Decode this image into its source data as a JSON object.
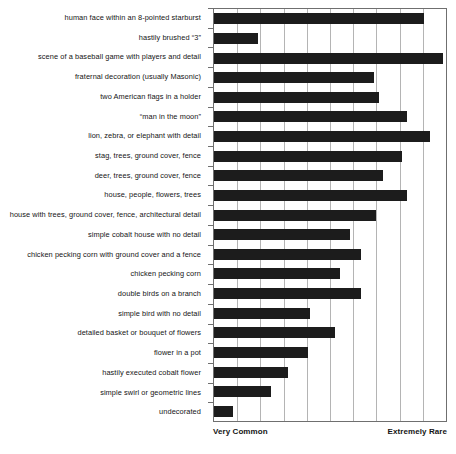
{
  "chart_data": {
    "type": "bar",
    "orientation": "horizontal",
    "title": "",
    "xlabel": "",
    "ylabel": "",
    "xlim": [
      0,
      10
    ],
    "grid": true,
    "axis_captions": {
      "left": "Very Common",
      "right": "Extremely Rare"
    },
    "categories": [
      "human face within an 8-pointed starburst",
      "hastily brushed “3”",
      "scene of a baseball game with players and detail",
      "fraternal decoration (usually Masonic)",
      "two American flags in a holder",
      "“man in the moon”",
      "lion, zebra, or elephant with detail",
      "stag, trees, ground cover, fence",
      "deer, trees, ground cover, fence",
      "house, people, flowers, trees",
      "house with trees, ground cover, fence, architectural detail",
      "simple cobalt house with no detail",
      "chicken pecking corn with ground cover and a fence",
      "chicken pecking corn",
      "double birds on a branch",
      "simple bird with no detail",
      "detailed basket or bouquet of flowers",
      "flower in a pot",
      "hastily executed cobalt flower",
      "simple swirl or geometric lines",
      "undecorated"
    ],
    "values": [
      9.05,
      1.9,
      9.85,
      6.9,
      7.1,
      8.3,
      9.3,
      8.1,
      7.3,
      8.3,
      7.0,
      5.85,
      6.35,
      5.45,
      6.35,
      4.15,
      5.2,
      4.05,
      3.2,
      2.45,
      0.8
    ],
    "bar_color": "#1c1c1c",
    "grid_color": "#b4b4b4",
    "axis_color": "#6f6f6f",
    "gridline_positions": [
      1,
      2,
      3,
      4,
      5,
      6,
      7,
      8,
      9
    ]
  }
}
